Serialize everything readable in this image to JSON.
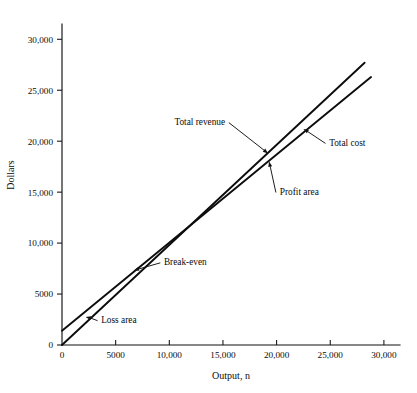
{
  "chart_data": {
    "type": "line",
    "title": "",
    "xlabel": "Output, n",
    "ylabel": "Dollars",
    "xlim": [
      0,
      31500
    ],
    "ylim": [
      0,
      31500
    ],
    "grid": false,
    "legend_position": "inline-annotations",
    "x_ticks": [
      0,
      5000,
      10000,
      15000,
      20000,
      25000,
      30000
    ],
    "x_tick_labels": [
      "0",
      "5000",
      "10,000",
      "15,000",
      "20,000",
      "25,000",
      "30,000"
    ],
    "y_ticks": [
      0,
      5000,
      10000,
      15000,
      20000,
      25000,
      30000
    ],
    "y_tick_labels": [
      "0",
      "5000",
      "10,000",
      "15,000",
      "20,000",
      "25,000",
      "30,000"
    ],
    "series": [
      {
        "name": "Total revenue",
        "x": [
          0,
          28200
        ],
        "values": [
          0,
          27700
        ]
      },
      {
        "name": "Total cost",
        "x": [
          0,
          28800
        ],
        "values": [
          1400,
          26300
        ]
      }
    ],
    "annotations": [
      {
        "name": "total-revenue",
        "text": "Total revenue",
        "label_x": 15200,
        "label_y": 21900,
        "point_x": 19200,
        "point_y": 18800
      },
      {
        "name": "total-cost",
        "text": "Total cost",
        "label_x": 24900,
        "label_y": 19900,
        "point_x": 22500,
        "point_y": 21200
      },
      {
        "name": "profit-area",
        "text": "Profit area",
        "label_x": 20300,
        "label_y": 15100,
        "point_x": 19300,
        "point_y": 18000
      },
      {
        "name": "break-even",
        "text": "Break-even",
        "label_x": 9500,
        "label_y": 8150,
        "point_x": 6700,
        "point_y": 7300
      },
      {
        "name": "loss-area",
        "text": "Loss area",
        "label_x": 3650,
        "label_y": 2500,
        "point_x": 2200,
        "point_y": 2750
      }
    ]
  },
  "figure": {
    "caption": ""
  }
}
